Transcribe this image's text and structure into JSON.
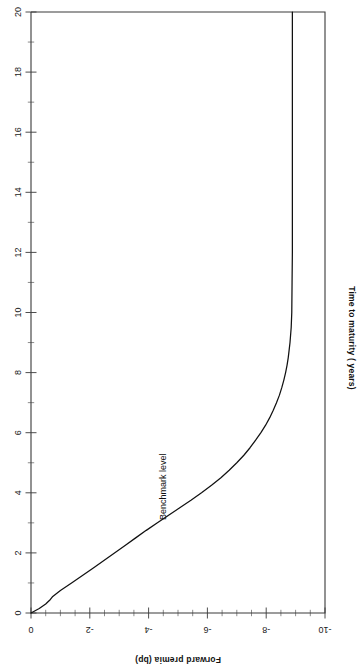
{
  "chart_data": {
    "type": "line",
    "title": "",
    "orientation": "rotated-90",
    "xlabel": "Forward premia (bp)",
    "ylabel": "Time to maturity ( years)",
    "xlim": [
      0,
      -10
    ],
    "ylim": [
      0,
      20
    ],
    "grid": false,
    "legend": null,
    "x_axis": {
      "label": "Forward premia (bp)",
      "label_rotation_deg": 180,
      "position": "bottom",
      "tick_labels": [
        "0",
        "-2",
        "-4",
        "-6",
        "-8",
        "-10"
      ],
      "tick_values": [
        0,
        -2,
        -4,
        -6,
        -8,
        -10
      ],
      "tick_label_rotation_deg": 180,
      "minor_tick_step": 0.5
    },
    "y_axis": {
      "label": "Time to maturity ( years)",
      "label_rotation_deg": 90,
      "position": "left",
      "tick_labels": [
        "0",
        "2",
        "4",
        "6",
        "8",
        "10",
        "12",
        "14",
        "16",
        "18",
        "20"
      ],
      "tick_values": [
        0,
        2,
        4,
        6,
        8,
        10,
        12,
        14,
        16,
        18,
        20
      ],
      "tick_label_rotation_deg": 90,
      "minor_tick_step": 1
    },
    "annotations": [
      {
        "name": "benchmark-level",
        "text": "Benchmark level",
        "rotation_deg": 90,
        "at_x_bp": -4.5,
        "at_y_years": 4.2
      }
    ],
    "series": [
      {
        "name": "Forward premia curve",
        "color": "#111111",
        "x_label": "Time to maturity (years)",
        "y_label": "Forward premia (bp)",
        "points": [
          {
            "t": 0.0,
            "premia": 0.0
          },
          {
            "t": 0.15,
            "premia": -0.28
          },
          {
            "t": 0.3,
            "premia": -0.5
          },
          {
            "t": 0.45,
            "premia": -0.66
          },
          {
            "t": 0.55,
            "premia": -0.74
          },
          {
            "t": 0.75,
            "premia": -1.0
          },
          {
            "t": 1.0,
            "premia": -1.38
          },
          {
            "t": 1.25,
            "premia": -1.75
          },
          {
            "t": 1.5,
            "premia": -2.12
          },
          {
            "t": 1.75,
            "premia": -2.48
          },
          {
            "t": 2.0,
            "premia": -2.84
          },
          {
            "t": 2.25,
            "premia": -3.2
          },
          {
            "t": 2.5,
            "premia": -3.56
          },
          {
            "t": 2.75,
            "premia": -3.92
          },
          {
            "t": 3.0,
            "premia": -4.3
          },
          {
            "t": 3.25,
            "premia": -4.68
          },
          {
            "t": 3.5,
            "premia": -5.06
          },
          {
            "t": 3.75,
            "premia": -5.44
          },
          {
            "t": 4.0,
            "premia": -5.8
          },
          {
            "t": 4.25,
            "premia": -6.14
          },
          {
            "t": 4.5,
            "premia": -6.46
          },
          {
            "t": 4.75,
            "premia": -6.74
          },
          {
            "t": 5.0,
            "premia": -7.0
          },
          {
            "t": 5.25,
            "premia": -7.24
          },
          {
            "t": 5.5,
            "premia": -7.45
          },
          {
            "t": 5.75,
            "premia": -7.64
          },
          {
            "t": 6.0,
            "premia": -7.82
          },
          {
            "t": 6.25,
            "premia": -7.98
          },
          {
            "t": 6.5,
            "premia": -8.12
          },
          {
            "t": 6.75,
            "premia": -8.24
          },
          {
            "t": 7.0,
            "premia": -8.35
          },
          {
            "t": 7.25,
            "premia": -8.45
          },
          {
            "t": 7.5,
            "premia": -8.53
          },
          {
            "t": 7.75,
            "premia": -8.6
          },
          {
            "t": 8.0,
            "premia": -8.66
          },
          {
            "t": 8.25,
            "premia": -8.71
          },
          {
            "t": 8.5,
            "premia": -8.75
          },
          {
            "t": 8.75,
            "premia": -8.78
          },
          {
            "t": 9.0,
            "premia": -8.81
          },
          {
            "t": 9.5,
            "premia": -8.85
          },
          {
            "t": 10.0,
            "premia": -8.87
          },
          {
            "t": 11.0,
            "premia": -8.88
          },
          {
            "t": 12.0,
            "premia": -8.89
          },
          {
            "t": 14.0,
            "premia": -8.89
          },
          {
            "t": 16.0,
            "premia": -8.89
          },
          {
            "t": 18.0,
            "premia": -8.89
          },
          {
            "t": 20.0,
            "premia": -8.89
          }
        ]
      }
    ]
  }
}
